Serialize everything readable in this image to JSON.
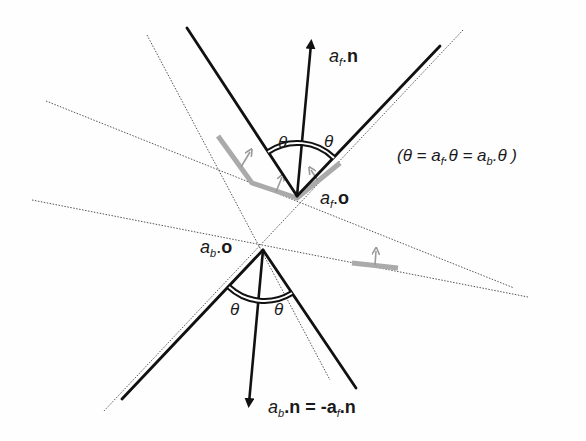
{
  "diagram": {
    "type": "geometric-construction",
    "colors": {
      "solid_lines": "#111111",
      "dotted_lines": "#555555",
      "gray_path": "#aaaaaa",
      "background": "#fefefe"
    },
    "front_angle": {
      "apex_label_a": "a",
      "apex_label_sub": "f",
      "apex_label_dot": ".",
      "apex_label_vec": "o",
      "normal_label_a": "a",
      "normal_label_sub": "f",
      "normal_label_dot": ".",
      "normal_label_vec": "n",
      "theta_left": "θ",
      "theta_right": "θ"
    },
    "back_angle": {
      "apex_label_a": "a",
      "apex_label_sub": "b",
      "apex_label_dot": ".",
      "apex_label_vec": "o",
      "normal_label_a": "a",
      "normal_label_sub": "b",
      "normal_label_eq": ".n = -a",
      "normal_label_sub2": "f",
      "normal_label_end": ".n",
      "theta_left": "θ",
      "theta_right": "θ"
    },
    "equation": {
      "open": "(θ = a",
      "sub1": "f",
      "mid": ".θ = a",
      "sub2": "b",
      "close": ".θ )"
    }
  }
}
